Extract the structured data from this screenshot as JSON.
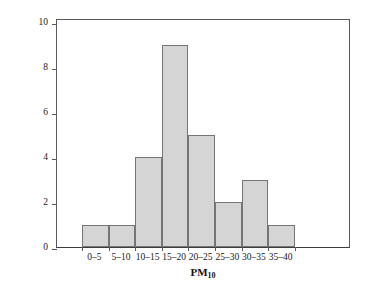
{
  "chart_data": {
    "type": "bar",
    "title": "",
    "subtitle": "",
    "xlabel": "PM10",
    "xlabel_base": "PM",
    "xlabel_subscript": "10",
    "ylabel": "Frequency",
    "categories": [
      "0–5",
      "5–10",
      "10–15",
      "15–20",
      "20–25",
      "25–30",
      "30–35",
      "35–40"
    ],
    "values": [
      1,
      1,
      4,
      9,
      5,
      2,
      3,
      1
    ],
    "ylim": [
      0,
      10.2
    ],
    "ytick_values": [
      0,
      2,
      4,
      6,
      8,
      10
    ],
    "ytick_labels": [
      "0",
      "2",
      "4",
      "6",
      "8",
      "10"
    ],
    "grid": false,
    "legend": null,
    "bar_fill_color": "#d5d5d5",
    "bar_edge_color": "#757575",
    "axis_color": "#5a5a5a",
    "background_color": "#ffffff"
  }
}
